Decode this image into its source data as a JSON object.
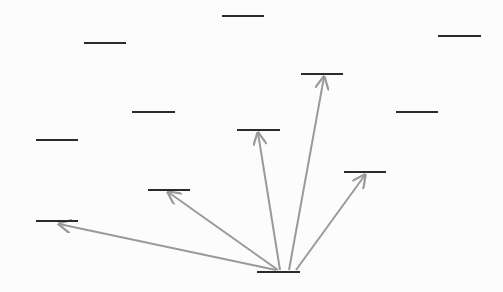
{
  "diagram": {
    "type": "fan-out arrows between horizontal level markers",
    "colors": {
      "marker": "#2b2b2b",
      "arrow": "#9a9a9a",
      "background": "#fcfcfc"
    },
    "markers": [
      {
        "id": "m1",
        "x1": 222,
        "x2": 264,
        "y": 16
      },
      {
        "id": "m2",
        "x1": 84,
        "x2": 126,
        "y": 43
      },
      {
        "id": "m3",
        "x1": 438,
        "x2": 481,
        "y": 36
      },
      {
        "id": "m4",
        "x1": 301,
        "x2": 343,
        "y": 74
      },
      {
        "id": "m5",
        "x1": 132,
        "x2": 175,
        "y": 112
      },
      {
        "id": "m6",
        "x1": 396,
        "x2": 438,
        "y": 112
      },
      {
        "id": "m7",
        "x1": 36,
        "x2": 78,
        "y": 140
      },
      {
        "id": "m8",
        "x1": 237,
        "x2": 280,
        "y": 130
      },
      {
        "id": "m9",
        "x1": 148,
        "x2": 190,
        "y": 190
      },
      {
        "id": "m10",
        "x1": 344,
        "x2": 386,
        "y": 172
      },
      {
        "id": "m11",
        "x1": 36,
        "x2": 78,
        "y": 221
      },
      {
        "id": "source",
        "x1": 257,
        "x2": 300,
        "y": 272
      }
    ],
    "arrows": [
      {
        "from": "source",
        "to": "m11",
        "x1": 276,
        "y1": 270,
        "x2": 59,
        "y2": 224
      },
      {
        "from": "source",
        "to": "m9",
        "x1": 278,
        "y1": 270,
        "x2": 168,
        "y2": 192
      },
      {
        "from": "source",
        "to": "m8",
        "x1": 280,
        "y1": 270,
        "x2": 258,
        "y2": 133
      },
      {
        "from": "source",
        "to": "m4",
        "x1": 289,
        "y1": 270,
        "x2": 324,
        "y2": 77
      },
      {
        "from": "source",
        "to": "m10",
        "x1": 296,
        "y1": 270,
        "x2": 365,
        "y2": 175
      }
    ]
  }
}
